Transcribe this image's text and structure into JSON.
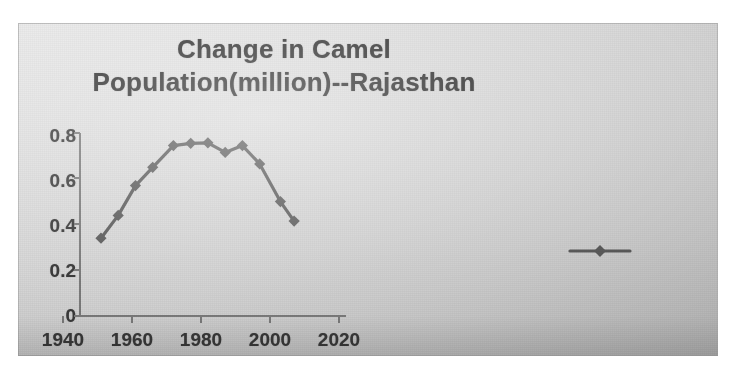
{
  "chart_data": {
    "type": "line",
    "title": "Change in  Camel Population(million)--Rajasthan",
    "title_line1": "Change in  Camel",
    "title_line2": "Population(million)--Rajasthan",
    "xlabel": "",
    "ylabel": "",
    "xlim": [
      1940,
      2028
    ],
    "ylim": [
      0,
      0.8
    ],
    "xticks": [
      "1940",
      "1960",
      "1980",
      "2000",
      "2020"
    ],
    "xtick_values": [
      1940,
      1960,
      1980,
      2000,
      2020
    ],
    "yticks": [
      "0",
      "0.2",
      "0.4",
      "0.6",
      "0.8"
    ],
    "ytick_values": [
      0,
      0.2,
      0.4,
      0.6,
      0.8
    ],
    "grid": false,
    "legend_position": "right",
    "marker": "diamond",
    "series_color": "#5a5a5a",
    "series": [
      {
        "name": "Camel population (million)",
        "x": [
          1951,
          1956,
          1961,
          1966,
          1972,
          1977,
          1982,
          1987,
          1992,
          1997,
          2003,
          2007
        ],
        "values": [
          0.34,
          0.44,
          0.57,
          0.65,
          0.745,
          0.755,
          0.757,
          0.715,
          0.745,
          0.665,
          0.5,
          0.415
        ]
      }
    ],
    "legend_entries": [
      {
        "label": "",
        "color": "#5a5a5a",
        "marker": "diamond"
      }
    ],
    "annotations": []
  },
  "figure": {
    "background_color": "#d6d6d6",
    "page_background": "#ffffff",
    "text_color": "#2c2c2c",
    "axis_color": "#7a7a7a",
    "quality_note": "scanned"
  }
}
